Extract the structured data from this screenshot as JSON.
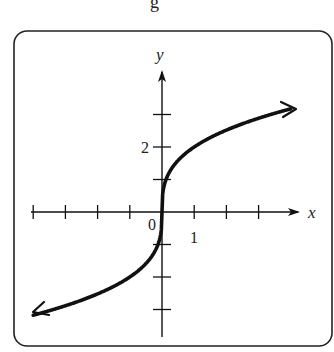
{
  "header": {
    "fragment": "g"
  },
  "chart_data": {
    "type": "line",
    "title": "",
    "function": "y = 2·∛x",
    "xlabel": "x",
    "ylabel": "y",
    "x_tick_label": "1",
    "y_tick_label": "2",
    "origin_label": "0",
    "xlim": [
      -4.2,
      4.3
    ],
    "ylim": [
      -3.8,
      3.8
    ],
    "x_ticks": [
      -4,
      -3,
      -2,
      -1,
      1,
      2,
      3
    ],
    "y_ticks": [
      -3,
      -2,
      -1,
      1,
      2,
      3
    ],
    "grid": false,
    "series": [
      {
        "name": "curve",
        "x": [
          -4,
          -3,
          -2,
          -1,
          -0.5,
          -0.125,
          0,
          0.125,
          0.5,
          1,
          2,
          3,
          4
        ],
        "y": [
          -3.17,
          -2.88,
          -2.52,
          -2.0,
          -1.59,
          -1.0,
          0,
          1.0,
          1.59,
          2.0,
          2.52,
          2.88,
          3.17
        ],
        "arrows_both_ends": true
      }
    ]
  }
}
